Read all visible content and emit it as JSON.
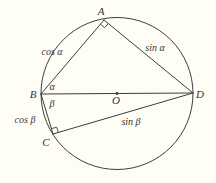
{
  "figure": {
    "points": {
      "A": "A",
      "B": "B",
      "C": "C",
      "D": "D",
      "O": "O"
    },
    "segments": {
      "AB": "cos α",
      "AD": "sin α",
      "BC": "cos β",
      "CD": "sin β"
    },
    "angles": {
      "alpha": "α",
      "beta": "β"
    }
  },
  "colors": {
    "background": "#fffef6",
    "line": "#3d3d3d",
    "text": "#333333"
  }
}
